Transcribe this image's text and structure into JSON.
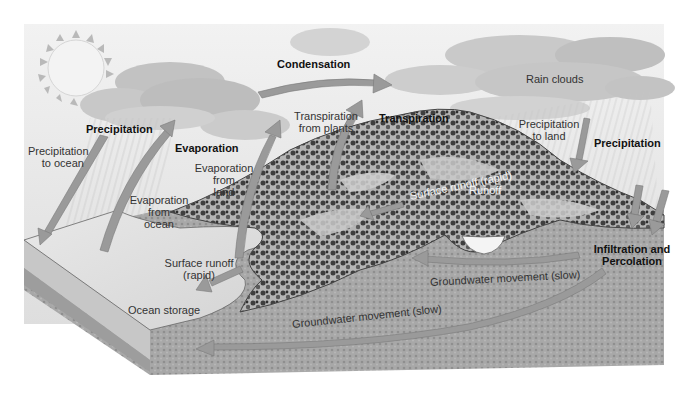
{
  "diagram": {
    "colors": {
      "sky": "#e6e6e6",
      "cloud": "#c9c9c9",
      "arrow": "#9a9a9a",
      "ocean": "#e2e2e2",
      "ground": "#a3a3a3",
      "vegetation": "#4a4a4a"
    },
    "labels": {
      "condensation": "Condensation",
      "rain_clouds": "Rain clouds",
      "precipitation_left": "Precipitation",
      "precipitation_right": "Precipitation",
      "precipitation_to_ocean_1": "Precipitation",
      "precipitation_to_ocean_2": "to ocean",
      "evaporation": "Evaporation",
      "transpiration_from_plants_1": "Transpiration",
      "transpiration_from_plants_2": "from plants",
      "transpiration": "Transpiration",
      "precipitation_to_land_1": "Precipitation",
      "precipitation_to_land_2": "to land",
      "evaporation_from_land_1": "Evaporation",
      "evaporation_from_land_2": "from",
      "evaporation_from_land_3": "land",
      "evaporation_from_ocean_1": "Evaporation",
      "evaporation_from_ocean_2": "from",
      "evaporation_from_ocean_3": "ocean",
      "surface_runoff_rapid_hill": "Surface runoff (rapid)",
      "runoff": "Runoff",
      "surface_runoff_1": "Surface runoff",
      "surface_runoff_2": "(rapid)",
      "ocean_storage": "Ocean storage",
      "infiltration_1": "Infiltration and",
      "infiltration_2": "Percolation",
      "groundwater_upper": "Groundwater movement (slow)",
      "groundwater_lower": "Groundwater movement (slow)"
    }
  }
}
